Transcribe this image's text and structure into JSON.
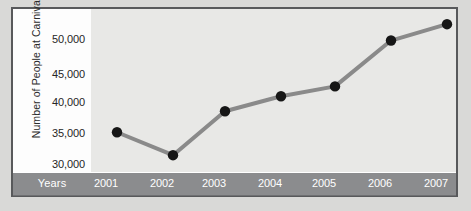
{
  "chart_data": {
    "type": "line",
    "title": "",
    "xlabel": "Years",
    "ylabel": "Number of People at Carnival",
    "categories": [
      "2001",
      "2002",
      "2003",
      "2004",
      "2005",
      "2006",
      "2007"
    ],
    "values": [
      35000,
      31500,
      38200,
      40500,
      42000,
      49000,
      51500
    ],
    "series": [
      {
        "name": "Number of People at Carnival",
        "values": [
          35000,
          31500,
          38200,
          40500,
          42000,
          49000,
          51500
        ]
      }
    ],
    "ylim": [
      28500,
      52500
    ],
    "yticks": [
      30000,
      35000,
      40000,
      45000,
      50000
    ],
    "ytick_labels": [
      "30,000",
      "35,000",
      "40,000",
      "45,000",
      "50,000"
    ],
    "grid": false,
    "legend": "none",
    "marker": "circle",
    "colors": {
      "line": "#8a8a8a",
      "marker": "#161616",
      "plot_background": "#e8e8e6",
      "axis_band": "#8b8c8e",
      "axis_band_text": "#ffffff",
      "frame_border": "#58595b",
      "figure_background": "#d9d9d7",
      "tick_label_text": "#262626"
    }
  },
  "axis": {
    "y_title": "Number of People at Carnival",
    "x_title": "Years",
    "y_labels": [
      "50,000",
      "45,000",
      "40,000",
      "35,000",
      "30,000"
    ],
    "x_labels": [
      "2001",
      "2002",
      "2003",
      "2004",
      "2005",
      "2006",
      "2007"
    ]
  }
}
